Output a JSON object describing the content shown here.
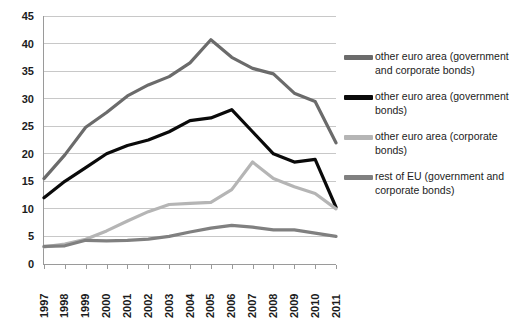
{
  "chart_data": {
    "type": "line",
    "title": "",
    "xlabel": "",
    "ylabel": "",
    "categories": [
      "1997",
      "1998",
      "1999",
      "2000",
      "2001",
      "2002",
      "2003",
      "2004",
      "2005",
      "2006",
      "2007",
      "2008",
      "2009",
      "2010",
      "2011"
    ],
    "ylim": [
      0,
      45
    ],
    "ytick_values": [
      0,
      5,
      10,
      15,
      20,
      25,
      30,
      35,
      40,
      45
    ],
    "ytick_labels": [
      "0",
      "5",
      "10",
      "15",
      "20",
      "25",
      "30",
      "35",
      "40",
      "45"
    ],
    "grid": "horizontal",
    "legend_position": "right",
    "series": [
      {
        "name": "other euro area (government and corporate bonds)",
        "color": "#6b6b6b",
        "values": [
          15.5,
          19.8,
          24.8,
          27.5,
          30.5,
          32.5,
          34.0,
          36.5,
          40.7,
          37.5,
          35.5,
          34.5,
          31.0,
          29.5,
          22.0
        ]
      },
      {
        "name": "other euro area (government bonds)",
        "color": "#0a0a0a",
        "values": [
          12.0,
          15.0,
          17.5,
          20.0,
          21.5,
          22.5,
          24.0,
          26.0,
          26.5,
          28.0,
          24.0,
          20.0,
          18.5,
          19.0,
          10.3
        ]
      },
      {
        "name": "other euro area (corporate bonds)",
        "color": "#b5b5b5",
        "values": [
          3.1,
          3.6,
          4.5,
          6.0,
          7.8,
          9.5,
          10.8,
          11.0,
          11.2,
          13.5,
          18.5,
          15.5,
          14.0,
          12.8,
          10.0
        ]
      },
      {
        "name": "rest of EU (government and corporate bonds)",
        "color": "#808080",
        "values": [
          3.2,
          3.3,
          4.3,
          4.2,
          4.3,
          4.5,
          5.0,
          5.8,
          6.5,
          7.0,
          6.7,
          6.2,
          6.2,
          5.6,
          5.0
        ]
      }
    ]
  },
  "legend": {
    "entries": [
      {
        "label": "other euro area (government and corporate bonds)",
        "color": "#6b6b6b"
      },
      {
        "label": "other euro area (government bonds)",
        "color": "#0a0a0a"
      },
      {
        "label": "other euro area (corporate bonds)",
        "color": "#b5b5b5"
      },
      {
        "label": "rest of EU (government and corporate bonds)",
        "color": "#808080"
      }
    ]
  },
  "axis_colors": {
    "axis_line": "#9a9a9a",
    "grid_line": "#c8c8c8",
    "tick_text": "#1c1c1c"
  }
}
